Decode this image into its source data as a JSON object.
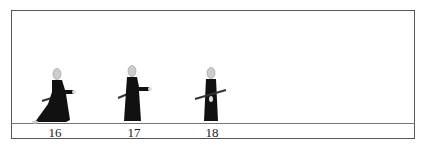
{
  "diagram": {
    "type": "kata-sequence",
    "colors": {
      "border": "#555555",
      "ground": "#777777",
      "robe": "#111111",
      "head": "#cccccc",
      "sword": "#333333"
    },
    "figures": [
      {
        "step": "16",
        "pose": "wide-stance-draw"
      },
      {
        "step": "17",
        "pose": "standing-hand-extended"
      },
      {
        "step": "18",
        "pose": "standing-sheathing"
      }
    ]
  }
}
